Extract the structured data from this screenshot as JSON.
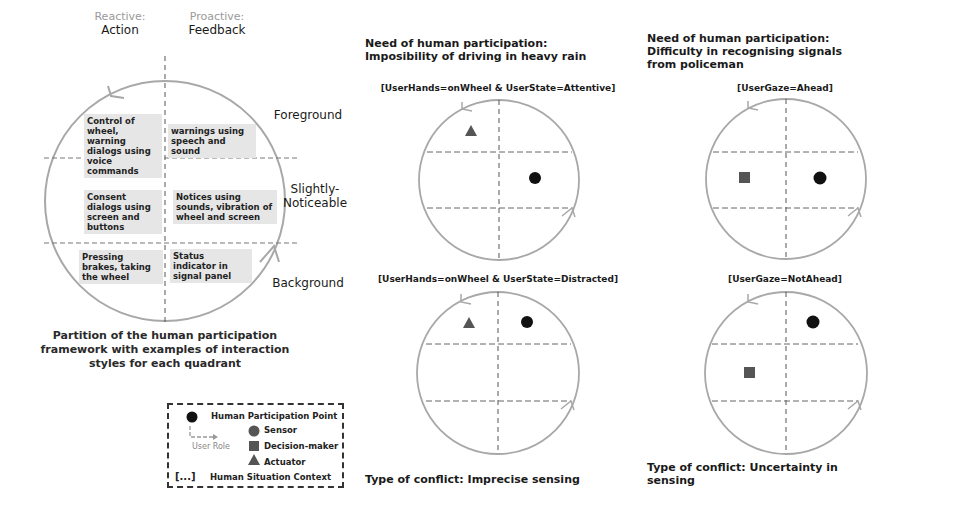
{
  "framework": {
    "columns": [
      {
        "kind": "Reactive:",
        "name": "Action"
      },
      {
        "kind": "Proactive:",
        "name": "Feedback"
      }
    ],
    "levels": [
      "Foreground",
      "Slightly-\nNoticeable",
      "Background"
    ],
    "level_line1": [
      "Foreground",
      "Slightly-",
      "Background"
    ],
    "level_line2": [
      "",
      "Noticeable",
      ""
    ],
    "quadrants": [
      {
        "row": "Foreground",
        "col": "Action",
        "text": "Control of wheel, warning dialogs using voice commands"
      },
      {
        "row": "Foreground",
        "col": "Feedback",
        "text": "warnings using speech and sound"
      },
      {
        "row": "Slightly-Noticeable",
        "col": "Action",
        "text": "Consent dialogs using screen and buttons"
      },
      {
        "row": "Slightly-Noticeable",
        "col": "Feedback",
        "text": "Notices using sounds, vibration of wheel and screen"
      },
      {
        "row": "Background",
        "col": "Action",
        "text": "Pressing brakes, taking the wheel"
      },
      {
        "row": "Background",
        "col": "Feedback",
        "text": "Status indicator in signal panel"
      }
    ],
    "caption": "Partition of the human participation framework with examples of interaction styles for each quadrant"
  },
  "legend": {
    "items": [
      {
        "icon": "black-dot",
        "label": "Human Participation Point"
      },
      {
        "icon": "circle",
        "label": "Sensor"
      },
      {
        "icon": "square",
        "label": "Decision-maker"
      },
      {
        "icon": "triangle",
        "label": "Actuator"
      },
      {
        "icon": "brackets",
        "label": "Human Situation Context"
      }
    ],
    "user_role": "User Role",
    "brackets_glyph": "[...]"
  },
  "panels": [
    {
      "title_line1": "Need of human participation:",
      "title_line2": "Imposibility of driving in heavy rain",
      "title_line3": "",
      "scenarios": [
        {
          "context": "[UserHands=onWheel & UserState=Attentive]",
          "role": "Actuator",
          "role_quadrant": "Foreground-Action",
          "point_quadrant": "Slightly-Noticeable-Feedback"
        },
        {
          "context": "[UserHands=onWheel & UserState=Distracted]",
          "role": "Actuator",
          "role_quadrant": "Foreground-Action",
          "point_quadrant": "Foreground-Feedback"
        }
      ],
      "conflict_line1": "Type of conflict: Imprecise sensing",
      "conflict_line2": ""
    },
    {
      "title_line1": "Need of human participation:",
      "title_line2": "Difficulty in recognising signals",
      "title_line3": "from policeman",
      "scenarios": [
        {
          "context": "[UserGaze=Ahead]",
          "role": "Decision-maker",
          "role_quadrant": "Slightly-Noticeable-Action",
          "point_quadrant": "Slightly-Noticeable-Feedback"
        },
        {
          "context": "[UserGaze=NotAhead]",
          "role": "Decision-maker",
          "role_quadrant": "Slightly-Noticeable-Action",
          "point_quadrant": "Foreground-Feedback"
        }
      ],
      "conflict_line1": "Type of conflict: Uncertainty in",
      "conflict_line2": "sensing"
    }
  ],
  "colors": {
    "circle_stroke": "#a8a8a8",
    "dashed_line": "#6a6a6a",
    "point": "#111111",
    "role_marker": "#5a5a5a",
    "header_bg": "#e9e9e9",
    "quadrant_bg": "#e6e6e6",
    "border": "#4a4a4a"
  }
}
